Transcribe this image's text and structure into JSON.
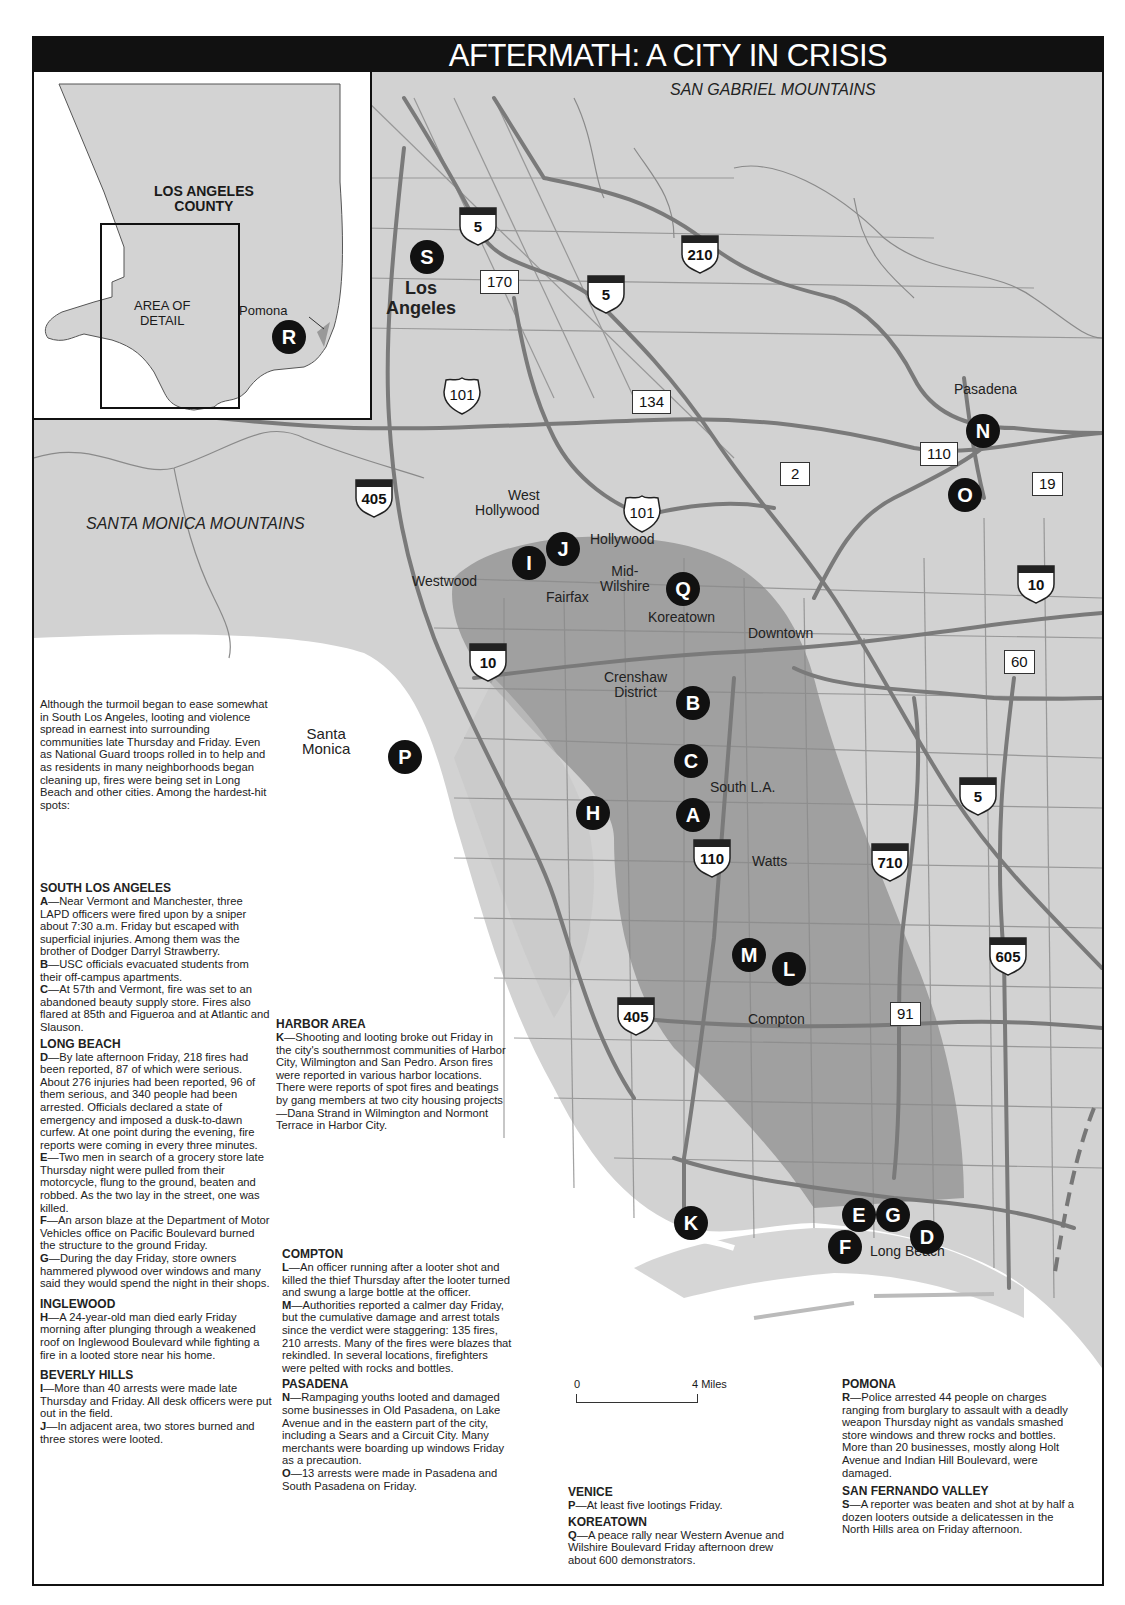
{
  "title": "AFTERMATH: A CITY IN CRISIS",
  "inset": {
    "county_label_line1": "LOS ANGELES",
    "county_label_line2": "COUNTY",
    "area_label_line1": "AREA OF",
    "area_label_line2": "DETAIL",
    "pomona_label": "Pomona",
    "marker": "R"
  },
  "map_labels": {
    "san_gabriel": "SAN GABRIEL MOUNTAINS",
    "santa_monica_mtns": "SANTA MONICA MOUNTAINS",
    "los_angeles_1": "Los",
    "los_angeles_2": "Angeles",
    "pasadena": "Pasadena",
    "west_hollywood_1": "West",
    "west_hollywood_2": "Hollywood",
    "hollywood": "Hollywood",
    "westwood": "Westwood",
    "fairfax": "Fairfax",
    "mid_wilshire_1": "Mid-",
    "mid_wilshire_2": "Wilshire",
    "koreatown": "Koreatown",
    "downtown": "Downtown",
    "crenshaw_1": "Crenshaw",
    "crenshaw_2": "District",
    "santa_monica_1": "Santa",
    "santa_monica_2": "Monica",
    "south_la": "South L.A.",
    "watts": "Watts",
    "compton": "Compton",
    "long_beach": "Long Beach"
  },
  "highways": {
    "i5_north": "5",
    "i210": "210",
    "sr170": "170",
    "i5_mid": "5",
    "us101_north": "101",
    "sr134": "134",
    "sr110_pas": "110",
    "sr2": "2",
    "sr19": "19",
    "i405_north": "405",
    "us101_hollywood": "101",
    "i10_east": "10",
    "i10_west": "10",
    "sr60": "60",
    "i5_south": "5",
    "i110": "110",
    "i710": "710",
    "i605": "605",
    "sr91": "91",
    "i405_south": "405"
  },
  "markers": [
    "A",
    "B",
    "C",
    "D",
    "E",
    "F",
    "G",
    "H",
    "I",
    "J",
    "K",
    "L",
    "M",
    "N",
    "O",
    "P",
    "Q",
    "S"
  ],
  "scale": {
    "start": "0",
    "end": "4 Miles"
  },
  "intro": "Although the turmoil began to ease somewhat in South Los Angeles, looting and violence spread in earnest into surrounding communities late Thursday and Friday. Even as National Guard troops rolled in to help and as residents in many neighborhoods began cleaning up, fires were being set in Long Beach and other cities. Among the hardest-hit spots:",
  "sections": {
    "south_la": {
      "heading": "SOUTH LOS ANGELES",
      "items": [
        {
          "key": "A",
          "text": "—Near Vermont and Manchester, three LAPD officers were fired upon by a sniper about 7:30 a.m. Friday but escaped with superficial injuries. Among them was the brother of Dodger Darryl Strawberry."
        },
        {
          "key": "B",
          "text": "—USC officials evacuated students from their off-campus apartments."
        },
        {
          "key": "C",
          "text": "—At 57th and Vermont, fire was set to an abandoned beauty supply store. Fires also flared at 85th and Figueroa and at Atlantic and Slauson."
        }
      ]
    },
    "long_beach": {
      "heading": "LONG BEACH",
      "items": [
        {
          "key": "D",
          "text": "—By late afternoon Friday, 218 fires had been reported, 87 of which were serious. About 276 injuries had been reported, 96 of them serious, and 340 people had been arrested. Officials declared a state of emergency and imposed a dusk-to-dawn curfew. At one point during the evening, fire reports were coming in every three minutes."
        },
        {
          "key": "E",
          "text": "—Two men in search of a grocery store late Thursday night were pulled from their motorcycle, flung to the ground, beaten and robbed. As the two lay in the street, one was killed."
        },
        {
          "key": "F",
          "text": "—An arson blaze at the Department of Motor Vehicles office on Pacific Boulevard burned the structure to the ground Friday."
        },
        {
          "key": "G",
          "text": "—During the day Friday, store owners hammered plywood over windows and many said they would spend the night in their shops."
        }
      ]
    },
    "inglewood": {
      "heading": "INGLEWOOD",
      "items": [
        {
          "key": "H",
          "text": "—A 24-year-old man died early Friday morning after plunging through a weakened roof on Inglewood Boulevard while fighting a fire in a looted store near his home."
        }
      ]
    },
    "beverly_hills": {
      "heading": "BEVERLY HILLS",
      "items": [
        {
          "key": "I",
          "text": "—More than 40 arrests were made late Thursday and Friday. All desk officers were put out in the field."
        },
        {
          "key": "J",
          "text": "—In adjacent area, two stores burned and three stores were looted."
        }
      ]
    },
    "harbor": {
      "heading": "HARBOR AREA",
      "items": [
        {
          "key": "K",
          "text": "—Shooting and looting broke out Friday in the city's southernmost communities of Harbor City, Wilmington and San Pedro. Arson fires were reported in various harbor locations. There were reports of spot fires and beatings by gang members at two city housing projects—Dana Strand in Wilmington and Normont Terrace in Harbor City."
        }
      ]
    },
    "compton": {
      "heading": "COMPTON",
      "items": [
        {
          "key": "L",
          "text": "—An officer running after a looter shot and killed the thief Thursday after the looter turned and swung a large bottle at the officer."
        },
        {
          "key": "M",
          "text": "—Authorities reported a calmer day Friday, but the cumulative damage and arrest totals since the verdict were staggering: 135 fires, 210 arrests. Many of the fires were blazes that rekindled. In several locations, firefighters were pelted with rocks and bottles."
        }
      ]
    },
    "pasadena": {
      "heading": "PASADENA",
      "items": [
        {
          "key": "N",
          "text": "—Rampaging youths looted and damaged some businesses in Old Pasadena, on Lake Avenue and in the eastern part of the city, including a Sears and a Circuit City. Many merchants were boarding up windows Friday as a precaution."
        },
        {
          "key": "O",
          "text": "—13 arrests were made in Pasadena and South Pasadena on Friday."
        }
      ]
    },
    "venice": {
      "heading": "VENICE",
      "items": [
        {
          "key": "P",
          "text": "—At least five lootings Friday."
        }
      ]
    },
    "koreatown": {
      "heading": "KOREATOWN",
      "items": [
        {
          "key": "Q",
          "text": "—A peace rally near Western Avenue and Wilshire Boulevard Friday afternoon drew about 600 demonstrators."
        }
      ]
    },
    "pomona": {
      "heading": "POMONA",
      "items": [
        {
          "key": "R",
          "text": "—Police arrested 44 people on charges ranging from burglary to assault with a deadly weapon Thursday night as vandals smashed store windows and threw rocks and bottles. More than 20 businesses, mostly along Holt Avenue and Indian Hill Boulevard, were damaged."
        }
      ]
    },
    "sfv": {
      "heading": "SAN FERNANDO VALLEY",
      "items": [
        {
          "key": "S",
          "text": "—A reporter was beaten and shot at by half a dozen looters outside a delicatessen in the North Hills area on Friday afternoon."
        }
      ]
    }
  }
}
